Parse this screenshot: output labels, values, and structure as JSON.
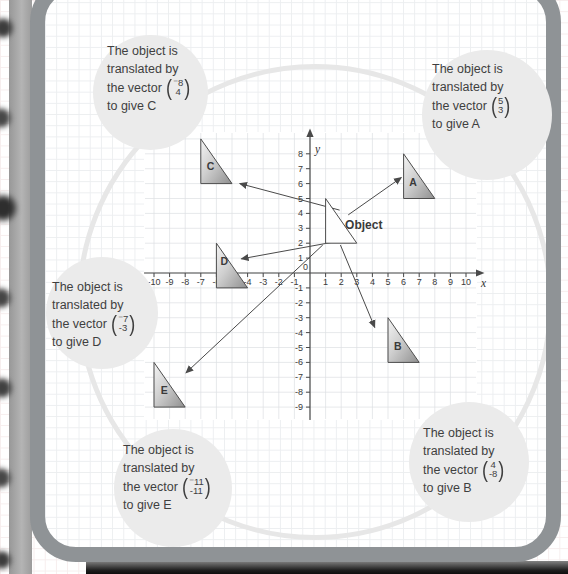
{
  "page": {
    "background": "#ffffff"
  },
  "notation": {
    "open": "(",
    "close": ")"
  },
  "callouts": [
    {
      "target": "C",
      "line1": "The object is",
      "line2": "translated by",
      "line3_prefix": "the vector",
      "vector_top": "⁻8",
      "vector_bottom": "4",
      "line4": "to give C"
    },
    {
      "target": "A",
      "line1": "The object is",
      "line2": "translated by",
      "line3_prefix": "the vector",
      "vector_top": "5",
      "vector_bottom": "3",
      "line4": "to give A"
    },
    {
      "target": "D",
      "line1": "The object is",
      "line2": "translated by",
      "line3_prefix": "the vector",
      "vector_top": "⁻7",
      "vector_bottom": "-3",
      "line4": "to give D"
    },
    {
      "target": "E",
      "line1": "The object is",
      "line2": "translated by",
      "line3_prefix": "the vector",
      "vector_top": "⁻11",
      "vector_bottom": "-11",
      "line4": "to give E"
    },
    {
      "target": "B",
      "line1": "The object is",
      "line2": "translated by",
      "line3_prefix": "the vector",
      "vector_top": "4",
      "vector_bottom": "-8",
      "line4": "to give B"
    }
  ],
  "chart_data": {
    "type": "coordinate-diagram",
    "x_axis_label": "x",
    "y_axis_label": "y",
    "origin_label": "0",
    "x_ticks": [
      -10,
      -9,
      -8,
      -7,
      -6,
      -5,
      -4,
      -3,
      -2,
      -1,
      1,
      2,
      3,
      4,
      5,
      6,
      7,
      8,
      9,
      10
    ],
    "y_ticks": [
      8,
      7,
      6,
      5,
      4,
      3,
      2,
      1,
      -1,
      -2,
      -3,
      -4,
      -5,
      -6,
      -7,
      -8,
      -9
    ],
    "xlim": [
      -10.6,
      10.9
    ],
    "ylim": [
      -9.9,
      9.5
    ],
    "grid": true,
    "shapes": [
      {
        "label": "Object",
        "points": [
          [
            1,
            5
          ],
          [
            1,
            2
          ],
          [
            3,
            2
          ]
        ],
        "fill": "white",
        "label_x": 2.25,
        "label_y": 2.95,
        "anchor": "start"
      },
      {
        "label": "A",
        "points": [
          [
            6,
            8
          ],
          [
            6,
            5
          ],
          [
            8,
            5
          ]
        ],
        "fill": "gradient",
        "label_x": 6.6,
        "label_y": 5.85,
        "anchor": "middle"
      },
      {
        "label": "B",
        "points": [
          [
            5,
            -3
          ],
          [
            5,
            -6
          ],
          [
            7,
            -6
          ]
        ],
        "fill": "gradient",
        "label_x": 5.62,
        "label_y": -5.15,
        "anchor": "middle"
      },
      {
        "label": "C",
        "points": [
          [
            -7,
            9
          ],
          [
            -7,
            6
          ],
          [
            -5,
            6
          ]
        ],
        "fill": "gradient",
        "label_x": -6.38,
        "label_y": 6.9,
        "anchor": "middle"
      },
      {
        "label": "D",
        "points": [
          [
            -6,
            2
          ],
          [
            -6,
            -1
          ],
          [
            -4,
            -1
          ]
        ],
        "fill": "gradient",
        "label_x": -5.5,
        "label_y": 0.55,
        "anchor": "middle"
      },
      {
        "label": "E",
        "points": [
          [
            -10,
            -6
          ],
          [
            -10,
            -9
          ],
          [
            -8,
            -9
          ]
        ],
        "fill": "gradient",
        "label_x": -9.35,
        "label_y": -8.1,
        "anchor": "middle"
      }
    ],
    "translations": [
      {
        "target": "A",
        "vector": [
          5,
          3
        ]
      },
      {
        "target": "B",
        "vector": [
          4,
          -8
        ]
      },
      {
        "target": "C",
        "vector": [
          -8,
          4
        ]
      },
      {
        "target": "D",
        "vector": [
          -7,
          -3
        ]
      },
      {
        "target": "E",
        "vector": [
          -11,
          -11
        ]
      }
    ],
    "arrows": [
      {
        "to": "A",
        "x1": 2.45,
        "y1": 3.9,
        "x2": 5.85,
        "y2": 6.4
      },
      {
        "to": "C",
        "x1": 1.9,
        "y1": 4.22,
        "x2": -4.5,
        "y2": 6.0
      },
      {
        "to": "D",
        "x1": 2.15,
        "y1": 2.2,
        "x2": -4.4,
        "y2": 0.95
      },
      {
        "to": "E",
        "x1": 0.82,
        "y1": 1.88,
        "x2": -7.95,
        "y2": -6.7
      },
      {
        "to": "B",
        "x1": 1.95,
        "y1": 1.88,
        "x2": 4.15,
        "y2": -3.65
      }
    ]
  }
}
